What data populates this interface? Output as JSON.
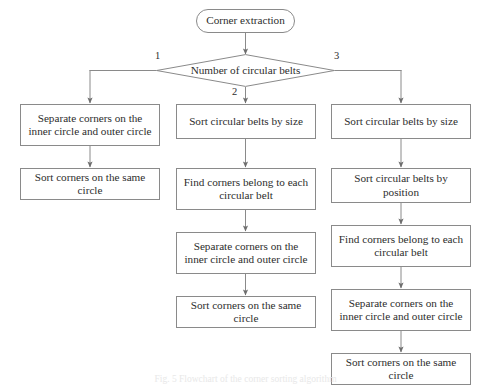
{
  "diagram": {
    "colors": {
      "stroke": "#8a8a8a",
      "text": "#2d2d2d",
      "background": "#ffffff",
      "arrow": "#6e6e6e"
    },
    "start": {
      "label": "Corner extraction",
      "shape": "stadium"
    },
    "decision": {
      "label": "Number of circular belts",
      "shape": "diamond",
      "branches": [
        {
          "value": "1",
          "position": "left"
        },
        {
          "value": "2",
          "position": "bottom"
        },
        {
          "value": "3",
          "position": "right"
        }
      ]
    },
    "columns": [
      {
        "branch": "1",
        "name": "one-belt-branch",
        "steps": [
          "Separate corners on the inner circle and outer circle",
          "Sort corners on the same circle"
        ]
      },
      {
        "branch": "2",
        "name": "two-belt-branch",
        "steps": [
          "Sort circular belts by size",
          "Find corners belong to each circular belt",
          "Separate corners on the inner circle and outer circle",
          "Sort corners on the same circle"
        ]
      },
      {
        "branch": "3",
        "name": "three-belt-branch",
        "steps": [
          "Sort circular belts by size",
          "Sort circular belts by position",
          "Find corners belong to each circular belt",
          "Separate corners on the inner circle and outer circle",
          "Sort corners on the same circle"
        ]
      }
    ],
    "caption": "Fig. 5  Flowchart of the corner sorting algorithm"
  }
}
